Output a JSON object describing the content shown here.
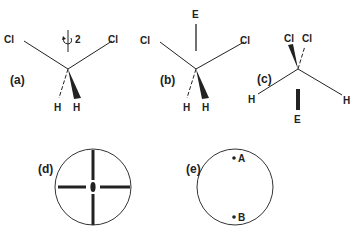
{
  "figure": {
    "panels": [
      {
        "id": "a",
        "label": "(a)",
        "atoms": {
          "cl_left": "Cl",
          "cl_right": "Cl",
          "h_left": "H",
          "h_right": "H"
        },
        "axis_label": "2"
      },
      {
        "id": "b",
        "label": "(b)",
        "atoms": {
          "cl_left": "Cl",
          "cl_right": "Cl",
          "h_left": "H",
          "h_right": "H",
          "top": "E"
        }
      },
      {
        "id": "c",
        "label": "(c)",
        "atoms": {
          "cl_left": "Cl",
          "cl_right": "Cl",
          "h_left": "H",
          "h_right": "H",
          "bottom": "E"
        }
      },
      {
        "id": "d",
        "label": "(d)"
      },
      {
        "id": "e",
        "label": "(e)",
        "points": {
          "top": "A",
          "bottom": "B"
        }
      }
    ]
  },
  "colors": {
    "ink": "#222222",
    "background": "#ffffff"
  }
}
